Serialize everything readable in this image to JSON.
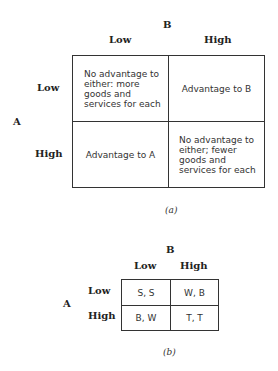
{
  "figure_a": {
    "col_player": "B",
    "row_player": "A",
    "col_labels": [
      "Low",
      "High"
    ],
    "row_labels": [
      "Low",
      "High"
    ],
    "cells": [
      [
        "No advantage to either: more goods and services for each",
        "Advantage to B"
      ],
      [
        "Advantage to A",
        "No advantage to either; fewer goods and services for each"
      ]
    ],
    "caption": "(a)"
  },
  "figure_b": {
    "col_player": "B",
    "row_player": "A",
    "col_labels": [
      "Low",
      "High"
    ],
    "row_labels": [
      "Low",
      "High"
    ],
    "cells": [
      [
        "S, S",
        "W, B"
      ],
      [
        "B, W",
        "T, T"
      ]
    ],
    "caption": "(b)"
  }
}
